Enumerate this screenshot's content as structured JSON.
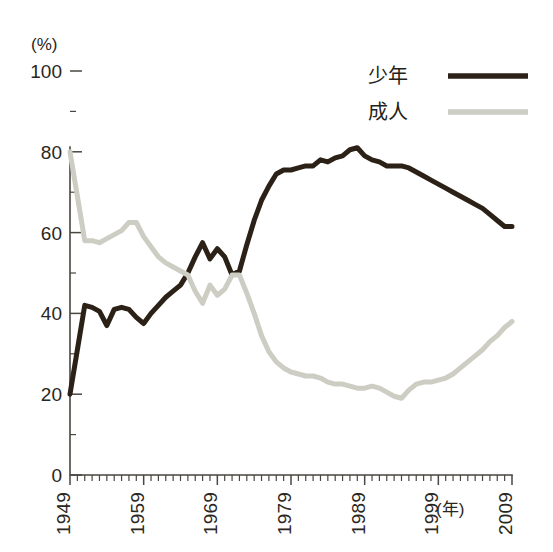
{
  "chart_data": {
    "type": "line",
    "title": "",
    "subtitle": "",
    "xlabel": "(年)",
    "ylabel": "(%)",
    "xlim": [
      1949,
      2009
    ],
    "ylim": [
      0,
      100
    ],
    "grid": false,
    "legend_position": "top-right",
    "y_ticks": [
      "0",
      "20",
      "40",
      "60",
      "80",
      "100"
    ],
    "y_tick_values": [
      0,
      20,
      40,
      60,
      80,
      100
    ],
    "y_minor_tick_values": [
      10,
      30,
      50,
      70,
      90
    ],
    "x_ticks": [
      "1949",
      "1959",
      "1969",
      "1979",
      "1989",
      "1999",
      "2009"
    ],
    "x_tick_values": [
      1949,
      1959,
      1969,
      1979,
      1989,
      1999,
      2009
    ],
    "x_minor_step": 1,
    "x": [
      1949,
      1950,
      1951,
      1952,
      1953,
      1954,
      1955,
      1956,
      1957,
      1958,
      1959,
      1960,
      1961,
      1962,
      1963,
      1964,
      1965,
      1966,
      1967,
      1968,
      1969,
      1970,
      1971,
      1972,
      1973,
      1974,
      1975,
      1976,
      1977,
      1978,
      1979,
      1980,
      1981,
      1982,
      1983,
      1984,
      1985,
      1986,
      1987,
      1988,
      1989,
      1990,
      1991,
      1992,
      1993,
      1994,
      1995,
      1996,
      1997,
      1998,
      1999,
      2000,
      2001,
      2002,
      2003,
      2004,
      2005,
      2006,
      2007,
      2008,
      2009
    ],
    "series": [
      {
        "name": "少年",
        "color": "#2b2117",
        "width": 5.0,
        "values": [
          20.0,
          31.0,
          42.0,
          41.5,
          40.5,
          37.0,
          41.0,
          41.5,
          41.0,
          39.0,
          37.5,
          40.0,
          42.0,
          44.0,
          45.5,
          47.0,
          50.0,
          54.0,
          57.5,
          53.5,
          56.0,
          54.0,
          49.5,
          50.5,
          57.0,
          63.0,
          68.0,
          71.5,
          74.5,
          75.5,
          75.5,
          76.0,
          76.5,
          76.5,
          78.0,
          77.5,
          78.5,
          79.0,
          80.5,
          81.0,
          79.0,
          78.0,
          77.5,
          76.5,
          76.5,
          76.5,
          76.0,
          75.0,
          74.0,
          73.0,
          72.0,
          71.0,
          70.0,
          69.0,
          68.0,
          67.0,
          66.0,
          64.5,
          63.0,
          61.5,
          61.5
        ]
      },
      {
        "name": "成人",
        "color": "#cdcdc4",
        "width": 5.0,
        "values": [
          80.0,
          69.0,
          58.0,
          58.0,
          57.5,
          58.5,
          59.5,
          60.5,
          62.5,
          62.5,
          59.0,
          56.5,
          54.0,
          52.5,
          51.5,
          50.5,
          49.5,
          45.5,
          42.5,
          47.0,
          44.5,
          46.0,
          49.5,
          49.5,
          45.0,
          40.0,
          34.5,
          30.5,
          28.0,
          26.5,
          25.5,
          25.0,
          24.5,
          24.5,
          24.0,
          23.0,
          22.5,
          22.5,
          22.0,
          21.5,
          21.5,
          22.0,
          21.5,
          20.5,
          19.5,
          19.0,
          21.0,
          22.5,
          23.0,
          23.0,
          23.5,
          24.0,
          25.0,
          26.5,
          28.0,
          29.5,
          31.0,
          33.0,
          34.5,
          36.5,
          38.0
        ]
      }
    ],
    "legend": [
      {
        "label": "少年",
        "color": "#2b2117"
      },
      {
        "label": "成人",
        "color": "#cdcdc4"
      }
    ]
  }
}
